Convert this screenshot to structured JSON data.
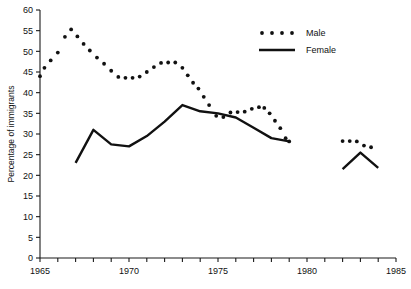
{
  "chart_data": {
    "type": "line",
    "title": "",
    "xlabel": "",
    "ylabel": "Percentage of immigrants",
    "xlim": [
      1965,
      1985
    ],
    "ylim": [
      0,
      60
    ],
    "ytick_step": 5,
    "xtick_step": 1,
    "xtick_label_step": 5,
    "x_tick_labels": [
      "1965",
      "1970",
      "1975",
      "1980",
      "1985"
    ],
    "x_tick_label_values": [
      1965,
      1970,
      1975,
      1980,
      1985
    ],
    "y_tick_labels": [
      "0",
      "5",
      "10",
      "15",
      "20",
      "25",
      "30",
      "35",
      "40",
      "45",
      "50",
      "55",
      "60"
    ],
    "y_tick_label_values": [
      0,
      5,
      10,
      15,
      20,
      25,
      30,
      35,
      40,
      45,
      50,
      55,
      60
    ],
    "grid": false,
    "legend_position": "top-right",
    "series": [
      {
        "name": "Male",
        "style": "dotted",
        "color": "#111111",
        "points": [
          [
            1965.0,
            44.0
          ],
          [
            1965.25,
            46.0
          ],
          [
            1965.6,
            47.8
          ],
          [
            1966.0,
            49.7
          ],
          [
            1966.4,
            53.5
          ],
          [
            1966.75,
            55.3
          ],
          [
            1967.1,
            53.6
          ],
          [
            1967.45,
            51.8
          ],
          [
            1967.8,
            50.2
          ],
          [
            1968.2,
            48.5
          ],
          [
            1968.6,
            47.0
          ],
          [
            1969.0,
            45.3
          ],
          [
            1969.4,
            43.8
          ],
          [
            1969.8,
            43.6
          ],
          [
            1970.2,
            43.6
          ],
          [
            1970.6,
            43.9
          ],
          [
            1971.0,
            45.0
          ],
          [
            1971.4,
            46.2
          ],
          [
            1971.8,
            47.2
          ],
          [
            1972.2,
            47.3
          ],
          [
            1972.6,
            47.3
          ],
          [
            1973.0,
            46.0
          ],
          [
            1973.3,
            44.2
          ],
          [
            1973.6,
            42.4
          ],
          [
            1973.9,
            41.0
          ],
          [
            1974.2,
            39.0
          ],
          [
            1974.5,
            37.0
          ],
          [
            1974.9,
            34.4
          ],
          [
            1975.3,
            34.1
          ],
          [
            1975.7,
            35.2
          ],
          [
            1976.1,
            35.3
          ],
          [
            1976.5,
            35.4
          ],
          [
            1976.9,
            36.1
          ],
          [
            1977.3,
            36.5
          ],
          [
            1977.6,
            36.3
          ],
          [
            1977.9,
            35.0
          ],
          [
            1978.2,
            33.2
          ],
          [
            1978.5,
            31.4
          ],
          [
            1978.8,
            29.0
          ],
          [
            1979.0,
            28.2
          ],
          [
            1982.0,
            28.3
          ],
          [
            1982.4,
            28.3
          ],
          [
            1982.8,
            28.2
          ],
          [
            1983.2,
            27.2
          ],
          [
            1983.6,
            26.8
          ]
        ]
      },
      {
        "name": "Female",
        "style": "solid",
        "color": "#111111",
        "points": [
          [
            1965.0,
            26.0
          ],
          [
            1967.0,
            23.0
          ],
          [
            1968.0,
            31.0
          ],
          [
            1969.0,
            27.5
          ],
          [
            1970.0,
            27.0
          ],
          [
            1971.0,
            29.5
          ],
          [
            1972.0,
            33.0
          ],
          [
            1973.0,
            37.0
          ],
          [
            1974.0,
            35.5
          ],
          [
            1975.0,
            35.0
          ],
          [
            1976.0,
            34.0
          ],
          [
            1977.0,
            31.5
          ],
          [
            1978.0,
            29.0
          ],
          [
            1979.0,
            28.2
          ],
          [
            1982.0,
            21.5
          ],
          [
            1983.0,
            25.5
          ],
          [
            1984.0,
            21.8
          ]
        ]
      }
    ],
    "legend": [
      {
        "label": "Male",
        "style": "dotted"
      },
      {
        "label": "Female",
        "style": "solid"
      }
    ]
  }
}
